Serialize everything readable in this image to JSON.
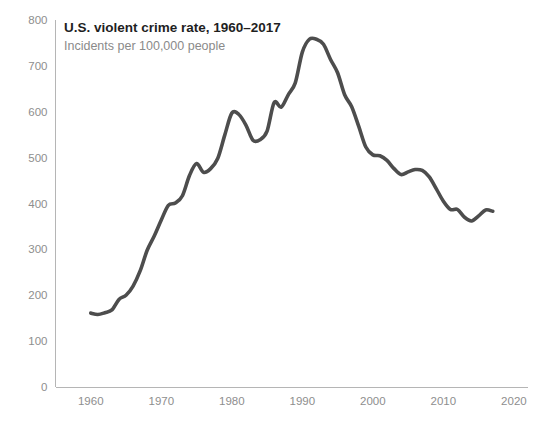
{
  "chart_data": {
    "type": "line",
    "title": "U.S. violent crime rate, 1960–2017",
    "subtitle": "Incidents per 100,000 people",
    "xlabel": "",
    "ylabel": "",
    "grid": false,
    "legend": "none",
    "xlim": [
      1955,
      2022
    ],
    "ylim": [
      0,
      800
    ],
    "xticks": [
      1960,
      1970,
      1980,
      1990,
      2000,
      2010,
      2020
    ],
    "xtick_labels": [
      "1960",
      "1970",
      "1980",
      "1990",
      "2000",
      "2010",
      "2020"
    ],
    "yticks": [
      0,
      100,
      200,
      300,
      400,
      500,
      600,
      700,
      800
    ],
    "ytick_labels": [
      "0",
      "100",
      "200",
      "300",
      "400",
      "500",
      "600",
      "700",
      "800"
    ],
    "series": [
      {
        "name": "Violent crime rate",
        "color": "#4d4d4d",
        "x": [
          1960,
          1961,
          1962,
          1963,
          1964,
          1965,
          1966,
          1967,
          1968,
          1969,
          1970,
          1971,
          1972,
          1973,
          1974,
          1975,
          1976,
          1977,
          1978,
          1979,
          1980,
          1981,
          1982,
          1983,
          1984,
          1985,
          1986,
          1987,
          1988,
          1989,
          1990,
          1991,
          1992,
          1993,
          1994,
          1995,
          1996,
          1997,
          1998,
          1999,
          2000,
          2001,
          2002,
          2003,
          2004,
          2005,
          2006,
          2007,
          2008,
          2009,
          2010,
          2011,
          2012,
          2013,
          2014,
          2015,
          2016,
          2017
        ],
        "values": [
          161,
          158,
          162,
          168,
          191,
          200,
          220,
          253,
          298,
          329,
          364,
          396,
          401,
          417,
          461,
          487,
          468,
          476,
          498,
          549,
          597,
          594,
          571,
          538,
          539,
          558,
          620,
          610,
          637,
          663,
          730,
          758,
          758,
          747,
          714,
          685,
          637,
          611,
          568,
          523,
          506,
          504,
          494,
          476,
          463,
          469,
          474,
          472,
          458,
          432,
          405,
          387,
          387,
          370,
          362,
          373,
          386,
          383
        ]
      }
    ],
    "annotations": {
      "peak_year": 1991,
      "peak_value": 758,
      "start_year": 1960,
      "start_value": 161,
      "end_year": 2017,
      "end_value": 383
    },
    "style": {
      "background": "#ffffff",
      "line_color": "#4d4d4d",
      "axis_color": "#b5b5b5",
      "tick_text_color": "#8e8e8e",
      "title_color": "#1f1f1f",
      "subtitle_color": "#8a8a8a"
    }
  }
}
